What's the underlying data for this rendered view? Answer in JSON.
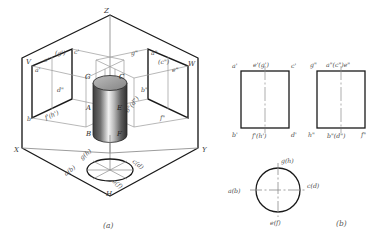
{
  "figure": {
    "caption_a": "(a)",
    "caption_b": "(b)",
    "axes": {
      "x": "X",
      "y": "Y",
      "z": "Z"
    },
    "planes": {
      "v": "V",
      "w": "W",
      "h": "H"
    }
  },
  "pictorial": {
    "v_plane_labels": {
      "a_prime": "a'",
      "e_prime": "e'",
      "g_prime_paren": "(g')",
      "c_prime": "c'",
      "b_prime": "b'",
      "f_h_prime": "f'(h')",
      "d_prime": "d\""
    },
    "w_plane_labels": {
      "g_dprime": "g\"",
      "a_dprime": "a\"",
      "c_dprime_paren": "(c\")",
      "e_dprime": "e\"",
      "b_dprime": "b\"",
      "b_d_dprime": "b\"(d\")",
      "f_dprime": "f\""
    },
    "solid_labels": {
      "G": "G",
      "C": "C",
      "A": "A",
      "E": "E",
      "B": "B",
      "F": "F"
    },
    "h_plane_labels": {
      "g_h": "g(h)",
      "a_b": "a(b)",
      "c_d": "c(d)",
      "e_f": "e(f)"
    }
  },
  "orthographic": {
    "front_view": {
      "top_left": "a'",
      "top_center": "e'(g')",
      "top_right": "c'",
      "bottom_left": "b'",
      "bottom_center": "f'(h')",
      "bottom_right": "d'"
    },
    "side_view": {
      "top_left": "g\"",
      "top_center": "a\"(c\")e\"",
      "bottom_left": "h\"",
      "bottom_center": "b\"(d\")",
      "bottom_right": "f\""
    },
    "top_view": {
      "top": "g(h)",
      "left": "a(b)",
      "right": "c(d)",
      "bottom": "e(f)"
    }
  },
  "colors": {
    "outline": "#1a1a1a",
    "thin": "#8a8a8a",
    "label": "#3a3a3a",
    "background": "#ffffff"
  }
}
